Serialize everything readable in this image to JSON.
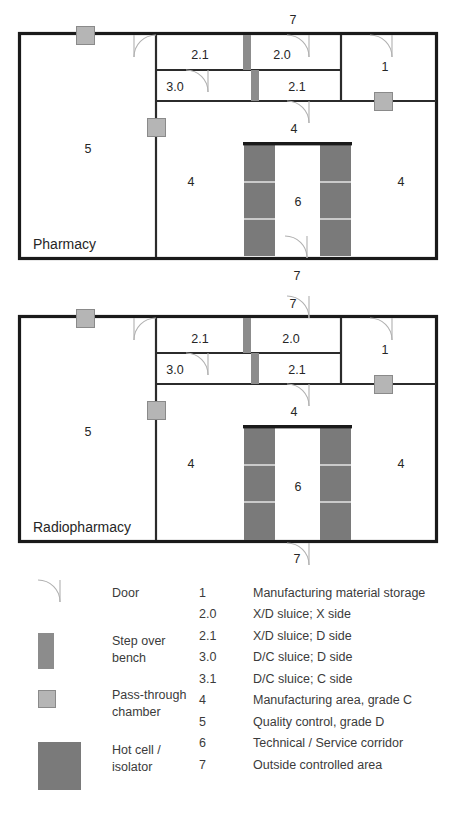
{
  "plans": [
    {
      "title": "Pharmacy",
      "rooms": [
        {
          "id": "r1-5",
          "label": "5",
          "x": 88,
          "y": 150
        },
        {
          "id": "r1-4a",
          "label": "4",
          "x": 191,
          "y": 183
        },
        {
          "id": "r1-4b",
          "label": "4",
          "x": 401,
          "y": 183
        },
        {
          "id": "r1-6",
          "label": "6",
          "x": 298,
          "y": 203
        },
        {
          "id": "r1-21a",
          "label": "2.1",
          "x": 200,
          "y": 56
        },
        {
          "id": "r1-20",
          "label": "2.0",
          "x": 282,
          "y": 56
        },
        {
          "id": "r1-30",
          "label": "3.0",
          "x": 175,
          "y": 88
        },
        {
          "id": "r1-21b",
          "label": "2.1",
          "x": 297,
          "y": 88
        },
        {
          "id": "r1-1",
          "label": "1",
          "x": 385,
          "y": 68
        }
      ],
      "outside_labels": [
        {
          "id": "p1-top7",
          "label": "7",
          "x": 293,
          "y": 21
        },
        {
          "id": "p1-bottom7",
          "label": "7",
          "x": 297,
          "y": 277
        },
        {
          "id": "p1-mid4",
          "label": "4",
          "x": 294,
          "y": 130
        }
      ],
      "has_inner_corridor_door": true
    },
    {
      "title": "Radiopharmacy",
      "rooms": [
        {
          "id": "r2-5",
          "label": "5",
          "x": 88,
          "y": 433
        },
        {
          "id": "r2-4a",
          "label": "4",
          "x": 191,
          "y": 465
        },
        {
          "id": "r2-4b",
          "label": "4",
          "x": 401,
          "y": 465
        },
        {
          "id": "r2-6",
          "label": "6",
          "x": 298,
          "y": 488
        },
        {
          "id": "r2-21a",
          "label": "2.1",
          "x": 200,
          "y": 340
        },
        {
          "id": "r2-20",
          "label": "2.0",
          "x": 291,
          "y": 340
        },
        {
          "id": "r2-30",
          "label": "3.0",
          "x": 175,
          "y": 371
        },
        {
          "id": "r2-21b",
          "label": "2.1",
          "x": 297,
          "y": 371
        },
        {
          "id": "r2-1",
          "label": "1",
          "x": 385,
          "y": 351
        }
      ],
      "outside_labels": [
        {
          "id": "p2-top7",
          "label": "7",
          "x": 293,
          "y": 305
        },
        {
          "id": "p2-bottom7",
          "label": "7",
          "x": 297,
          "y": 560
        },
        {
          "id": "p2-mid4",
          "label": "4",
          "x": 294,
          "y": 413
        }
      ],
      "has_inner_corridor_door": false
    }
  ],
  "legend": {
    "symbols": [
      {
        "id": "door",
        "name": "Door",
        "kind": "arc"
      },
      {
        "id": "step-over",
        "name": "Step over bench",
        "kind": "bench"
      },
      {
        "id": "pass-through",
        "name": "Pass-through chamber",
        "kind": "chamber"
      },
      {
        "id": "hot-cell",
        "name": "Hot cell / isolator",
        "kind": "hotcell"
      }
    ],
    "items": [
      {
        "num": "1",
        "desc": "Manufacturing material storage"
      },
      {
        "num": "2.0",
        "desc": "X/D sluice; X side"
      },
      {
        "num": "2.1",
        "desc": "X/D sluice; D side"
      },
      {
        "num": "3.0",
        "desc": "D/C sluice; D side"
      },
      {
        "num": "3.1",
        "desc": "D/C sluice; C side"
      },
      {
        "num": "4",
        "desc": "Manufacturing area, grade C"
      },
      {
        "num": "5",
        "desc": "Quality control, grade D"
      },
      {
        "num": "6",
        "desc": "Technical / Service corridor"
      },
      {
        "num": "7",
        "desc": "Outside controlled area"
      }
    ]
  },
  "colors": {
    "wall": "#1a1a1a",
    "thin_wall": "#2b2b2b",
    "step_over_bench": "#8c8c8c",
    "pass_through": "#b5b5b5",
    "pass_through_border": "#8a8a8a",
    "hot_cell": "#7a7a7a",
    "door_arc": "#b0b0b0",
    "background": "#ffffff",
    "text": "#262626"
  }
}
